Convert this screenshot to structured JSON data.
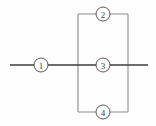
{
  "figure": {
    "name": "numbered-callout-schematic",
    "background_color": "#fefefe",
    "width": 156,
    "height": 126,
    "colors": {
      "main_line": "#3c3c3c",
      "rect_line": "#8a8a8a",
      "circle_stroke": "#5a5a5a",
      "label_text": "#3a3a3a",
      "circle_fill": "#ffffff"
    },
    "elements": {
      "horizontal_line": {
        "label": "horizontal axis line",
        "x1": 10,
        "y1": 65,
        "x2": 148,
        "y2": 65
      },
      "rectangle": {
        "label": "rectangular loop",
        "x": 78,
        "y": 14,
        "width": 50,
        "height": 98
      }
    },
    "callouts": [
      {
        "id": "callout-1",
        "label": "1",
        "cx": 41,
        "cy": 65,
        "r": 7
      },
      {
        "id": "callout-2",
        "label": "2",
        "cx": 103,
        "cy": 14,
        "r": 7
      },
      {
        "id": "callout-3",
        "label": "3",
        "cx": 103,
        "cy": 65,
        "r": 7
      },
      {
        "id": "callout-4",
        "label": "4",
        "cx": 103,
        "cy": 112,
        "r": 7
      }
    ]
  }
}
